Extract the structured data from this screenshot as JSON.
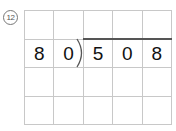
{
  "problem": {
    "number_label": "12",
    "number_display": "⑫"
  },
  "grid": {
    "columns": 5,
    "rows": 4,
    "cells": [
      [
        "",
        "",
        "",
        "",
        ""
      ],
      [
        "8",
        "0",
        "5",
        "0",
        "8"
      ],
      [
        "",
        "",
        "",
        "",
        ""
      ],
      [
        "",
        "",
        "",
        "",
        ""
      ]
    ]
  },
  "division": {
    "divisor": "80",
    "dividend": "508",
    "quotient": ""
  },
  "colors": {
    "grid_line": "#c8c8c8",
    "text": "#111111",
    "bracket": "#555555"
  }
}
